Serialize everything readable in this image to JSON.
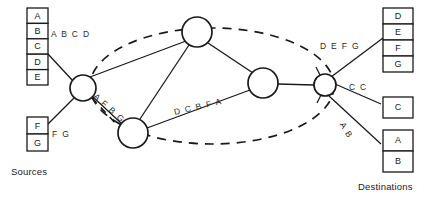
{
  "diagram": {
    "sources_caption": "Sources",
    "destinations_caption": "Destinations",
    "colors": {
      "line": "#1a1a1a",
      "node_fill": "#ffffff",
      "text": "#1a1a1a",
      "background": "#ffffff"
    },
    "source_stacks": [
      {
        "name": "source-stack-abcde",
        "cells": [
          {
            "label": "A"
          },
          {
            "label": "B"
          },
          {
            "label": "C"
          },
          {
            "label": "D"
          },
          {
            "label": "E"
          }
        ]
      },
      {
        "name": "source-stack-fg",
        "cells": [
          {
            "label": "F"
          },
          {
            "label": "G"
          }
        ]
      }
    ],
    "destination_stacks": [
      {
        "name": "destination-stack-defg",
        "cells": [
          {
            "label": "D"
          },
          {
            "label": "E"
          },
          {
            "label": "F"
          },
          {
            "label": "G"
          }
        ]
      },
      {
        "name": "destination-stack-c",
        "cells": [
          {
            "label": "C"
          }
        ]
      },
      {
        "name": "destination-stack-ab",
        "cells": [
          {
            "label": "A"
          },
          {
            "label": "B"
          }
        ]
      }
    ],
    "edge_labels": [
      {
        "name": "edge-label-abcd",
        "text": "A B C D",
        "rotation": 0
      },
      {
        "name": "edge-label-fg",
        "text": "F G",
        "rotation": 0
      },
      {
        "name": "edge-label-afbg",
        "text": "A F B G",
        "rotation": 42
      },
      {
        "name": "edge-label-dcbfa",
        "text": "D C B F A",
        "rotation": -13
      },
      {
        "name": "edge-label-defg",
        "text": "D E F G",
        "rotation": 0
      },
      {
        "name": "edge-label-cc",
        "text": "C C",
        "rotation": 0
      },
      {
        "name": "edge-label-ab",
        "text": "A B",
        "rotation": 58
      }
    ],
    "nodes": [
      {
        "name": "router-node-top",
        "cx": 197,
        "cy": 32,
        "r": 15
      },
      {
        "name": "router-node-left",
        "cx": 83,
        "cy": 88,
        "r": 13
      },
      {
        "name": "router-node-bottom",
        "cx": 133,
        "cy": 133,
        "r": 15
      },
      {
        "name": "router-node-middle",
        "cx": 263,
        "cy": 83,
        "r": 15
      },
      {
        "name": "router-node-right",
        "cx": 325,
        "cy": 85,
        "r": 11
      }
    ],
    "cloud": {
      "name": "network-cloud-boundary",
      "cx": 212,
      "cy": 86,
      "rx": 122,
      "ry": 58,
      "dash": "9 7"
    }
  }
}
